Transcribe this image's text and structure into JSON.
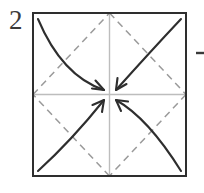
{
  "figure": {
    "kind": "origami-instruction-diagram",
    "step_number": "2"
  },
  "canvas": {
    "width": 204,
    "height": 193,
    "background": "#ffffff"
  },
  "colors": {
    "paper_outline": "#2e2e2e",
    "crease_dashed": "#9a9a9a",
    "crease_center_line": "#bdbdbd",
    "arrow_stroke": "#2e2e2e",
    "label_text": "#3a3a3a",
    "leader_dash": "#3a3a3a"
  },
  "paper": {
    "label": "square-sheet",
    "left": 33,
    "top": 13,
    "right": 186,
    "bottom": 176,
    "stroke_width": 2
  },
  "center_point": {
    "x": 109.5,
    "y": 94.5
  },
  "center_creases": [
    {
      "name": "horizontal-center-crease",
      "x1": 33,
      "y1": 94.5,
      "x2": 186,
      "y2": 94.5
    },
    {
      "name": "vertical-center-crease",
      "x1": 109.5,
      "y1": 13,
      "x2": 109.5,
      "y2": 176
    }
  ],
  "dashed_creases": [
    {
      "name": "crease-topleft-to-midtop",
      "x1": 33,
      "y1": 94.5,
      "x2": 109.5,
      "y2": 13
    },
    {
      "name": "crease-midtop-to-midright",
      "x1": 109.5,
      "y1": 13,
      "x2": 186,
      "y2": 94.5
    },
    {
      "name": "crease-midright-to-midbottom",
      "x1": 186,
      "y1": 94.5,
      "x2": 109.5,
      "y2": 176
    },
    {
      "name": "crease-midbottom-to-midleft",
      "x1": 109.5,
      "y1": 176,
      "x2": 33,
      "y2": 94.5
    }
  ],
  "arrows": [
    {
      "name": "fold-arrow-top-left",
      "from_corner": "top-left",
      "start": {
        "x": 38,
        "y": 19
      },
      "control": {
        "x": 62,
        "y": 76
      },
      "end": {
        "x": 104,
        "y": 90
      },
      "head_angle_deg": 20
    },
    {
      "name": "fold-arrow-top-right",
      "from_corner": "top-right",
      "start": {
        "x": 181,
        "y": 19
      },
      "control": {
        "x": 150,
        "y": 52
      },
      "end": {
        "x": 116,
        "y": 90
      },
      "head_angle_deg": 132
    },
    {
      "name": "fold-arrow-bottom-left",
      "from_corner": "bottom-left",
      "start": {
        "x": 38,
        "y": 171
      },
      "control": {
        "x": 72,
        "y": 140
      },
      "end": {
        "x": 104,
        "y": 100
      },
      "head_angle_deg": -52
    },
    {
      "name": "fold-arrow-bottom-right",
      "from_corner": "bottom-right",
      "start": {
        "x": 181,
        "y": 171
      },
      "control": {
        "x": 148,
        "y": 118
      },
      "end": {
        "x": 116,
        "y": 100
      },
      "head_angle_deg": -150
    }
  ],
  "leader_dash": {
    "name": "edge-leader-dash",
    "x1": 196,
    "y1": 53,
    "x2": 204,
    "y2": 53
  }
}
